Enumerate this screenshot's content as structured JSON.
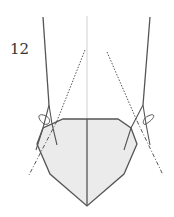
{
  "figure": {
    "number": "12"
  },
  "colors": {
    "background": "#ffffff",
    "hull_fill": "#ebebeb",
    "line": "#555555",
    "centerline": "#cfcfcf",
    "label": "#333333"
  }
}
